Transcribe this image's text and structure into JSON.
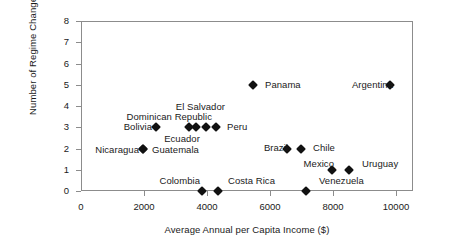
{
  "chart_data": {
    "type": "scatter",
    "title": "",
    "xlabel": "Average Annual per Capita Income ($)",
    "ylabel": "Number of Regime Changes",
    "xlim": [
      0,
      10200
    ],
    "ylim": [
      0,
      8
    ],
    "xticks": [
      0,
      2000,
      4000,
      6000,
      8000,
      10000
    ],
    "xtick_labels": [
      "0",
      "2000",
      "4000",
      "6000",
      "8000",
      "10000"
    ],
    "yticks": [
      0,
      1,
      2,
      3,
      4,
      5,
      6,
      7,
      8
    ],
    "ytick_labels": [
      "0",
      "1",
      "2",
      "3",
      "4",
      "5",
      "6",
      "7",
      "8"
    ],
    "grid": false,
    "legend": "none",
    "marker": "diamond",
    "marker_color": "#111111",
    "points": [
      {
        "label": "Panama",
        "x": 5450,
        "y": 5,
        "label_pos": "right"
      },
      {
        "label": "Argentina",
        "x": 9800,
        "y": 5,
        "label_pos": "left"
      },
      {
        "label": "Bolivia",
        "x": 2380,
        "y": 3,
        "label_pos": "left"
      },
      {
        "label": "Dominican Republic",
        "x": 3420,
        "y": 3,
        "label_pos": "above"
      },
      {
        "label": "El Salvador",
        "x": 3660,
        "y": 3,
        "label_pos": "above"
      },
      {
        "label": "Ecuador",
        "x": 3980,
        "y": 3,
        "label_pos": "below"
      },
      {
        "label": "Peru",
        "x": 4300,
        "y": 3,
        "label_pos": "right"
      },
      {
        "label": "Nicaragua",
        "x": 1980,
        "y": 2,
        "label_pos": "left"
      },
      {
        "label": "Guatemala",
        "x": 1980,
        "y": 2,
        "label_pos": "right"
      },
      {
        "label": "Brazil",
        "x": 6530,
        "y": 2,
        "label_pos": "left"
      },
      {
        "label": "Chile",
        "x": 6990,
        "y": 2,
        "label_pos": "right"
      },
      {
        "label": "Mexico",
        "x": 7970,
        "y": 1,
        "label_pos": "left"
      },
      {
        "label": "Uruguay",
        "x": 8500,
        "y": 1,
        "label_pos": "right"
      },
      {
        "label": "Colombia",
        "x": 3840,
        "y": 0,
        "label_pos": "above"
      },
      {
        "label": "Costa Rica",
        "x": 4340,
        "y": 0,
        "label_pos": "above"
      },
      {
        "label": "Venezuela",
        "x": 7140,
        "y": 0,
        "label_pos": "right-above"
      }
    ],
    "labels_rendered": [
      {
        "text": "Panama",
        "px": 265,
        "py": 85,
        "align": "right"
      },
      {
        "text": "Argentina",
        "px": 393,
        "py": 85,
        "align": "left"
      },
      {
        "text": "El Salvador",
        "px": 225,
        "py": 107,
        "align": "left"
      },
      {
        "text": "Dominican Republic",
        "px": 212,
        "py": 117,
        "align": "left"
      },
      {
        "text": "Bolivia",
        "px": 152,
        "py": 127,
        "align": "left"
      },
      {
        "text": "Peru",
        "px": 227,
        "py": 127,
        "align": "right"
      },
      {
        "text": "Ecuador",
        "px": 182,
        "py": 139,
        "align": "center"
      },
      {
        "text": "Brazil",
        "px": 288,
        "py": 148,
        "align": "left"
      },
      {
        "text": "Chile",
        "px": 313,
        "py": 148,
        "align": "right"
      },
      {
        "text": "Nicaragua",
        "px": 139,
        "py": 150,
        "align": "left"
      },
      {
        "text": "Guatemala",
        "px": 152,
        "py": 150,
        "align": "right"
      },
      {
        "text": "Mexico",
        "px": 334,
        "py": 164,
        "align": "left"
      },
      {
        "text": "Uruguay",
        "px": 362,
        "py": 164,
        "align": "right"
      },
      {
        "text": "Colombia",
        "px": 200,
        "py": 181,
        "align": "left"
      },
      {
        "text": "Costa Rica",
        "px": 228,
        "py": 181,
        "align": "right"
      },
      {
        "text": "Venezuela",
        "px": 319,
        "py": 181,
        "align": "right"
      }
    ]
  }
}
